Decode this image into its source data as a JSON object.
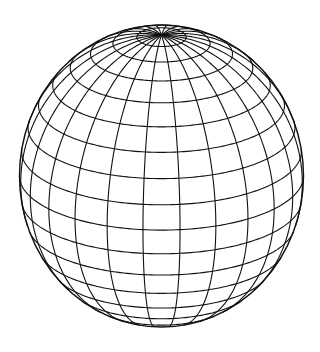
{
  "figure": {
    "background": "#ffffff",
    "stroke_color": "#111111",
    "stroke_width": 1.1,
    "center": [
      161.5,
      176
    ],
    "radius_x": 142,
    "radius_y": 151,
    "elevation_deg": 21,
    "meridian_count": 24,
    "meridian_offset_deg": 7.5,
    "parallel_step_deg": 10
  }
}
